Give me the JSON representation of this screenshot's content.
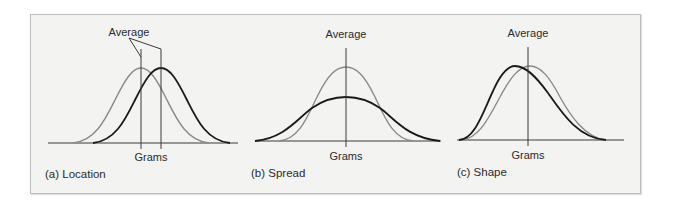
{
  "figure": {
    "panels": [
      {
        "id": "a",
        "caption": "(a) Location",
        "top_label": "Average",
        "axis_label": "Grams",
        "curves": [
          {
            "name": "reference",
            "color": "#8a8a8a",
            "center_x": 141
          },
          {
            "name": "shifted",
            "color": "#1a1a1a",
            "center_x": 161
          }
        ]
      },
      {
        "id": "b",
        "caption": "(b) Spread",
        "top_label": "Average",
        "axis_label": "Grams",
        "curves": [
          {
            "name": "narrow",
            "color": "#8a8a8a"
          },
          {
            "name": "wide",
            "color": "#1a1a1a"
          }
        ]
      },
      {
        "id": "c",
        "caption": "(c) Shape",
        "top_label": "Average",
        "axis_label": "Grams",
        "curves": [
          {
            "name": "symmetric",
            "color": "#8a8a8a"
          },
          {
            "name": "skewed",
            "color": "#1a1a1a"
          }
        ]
      }
    ],
    "colors": {
      "frame_bg": "#f3f3f2",
      "frame_border": "#bdbdbd",
      "axis": "#3a3a3a",
      "gray_curve": "#8a8a8a",
      "black_curve": "#1a1a1a"
    }
  }
}
